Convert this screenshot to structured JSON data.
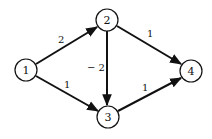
{
  "graph": {
    "type": "directed-weighted-graph",
    "nodes": [
      {
        "id": "1",
        "label": "1",
        "x": 26,
        "y": 70
      },
      {
        "id": "2",
        "label": "2",
        "x": 107,
        "y": 20
      },
      {
        "id": "3",
        "label": "3",
        "x": 108,
        "y": 117
      },
      {
        "id": "4",
        "label": "4",
        "x": 191,
        "y": 71
      }
    ],
    "edges": [
      {
        "from": "1",
        "to": "2",
        "weight": "2"
      },
      {
        "from": "1",
        "to": "3",
        "weight": "1"
      },
      {
        "from": "2",
        "to": "3",
        "weight": "− 2"
      },
      {
        "from": "2",
        "to": "4",
        "weight": "1"
      },
      {
        "from": "3",
        "to": "4",
        "weight": "1"
      }
    ],
    "node_radius": 11,
    "colors": {
      "stroke": "#111111",
      "background": "#ffffff"
    }
  }
}
